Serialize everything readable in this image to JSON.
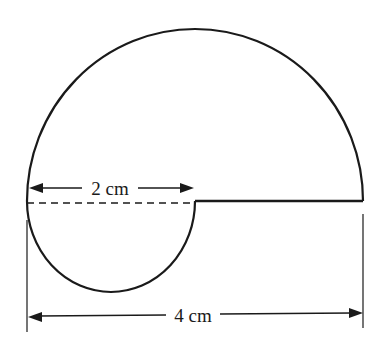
{
  "diagram": {
    "type": "geometry-figure",
    "colors": {
      "stroke": "#1a1a1a",
      "background": "#ffffff"
    },
    "shapes": {
      "large_semicircle": {
        "diameter": "4 cm",
        "position": "top"
      },
      "small_semicircle": {
        "diameter": "2 cm",
        "position": "bottom-left"
      },
      "straight_edge": {
        "length": "2 cm",
        "position": "right half of diameter"
      },
      "dashed_line": {
        "length": "2 cm",
        "position": "left half of diameter"
      }
    },
    "dimensions": {
      "small": {
        "label": "2 cm"
      },
      "large": {
        "label": "4 cm"
      }
    }
  }
}
